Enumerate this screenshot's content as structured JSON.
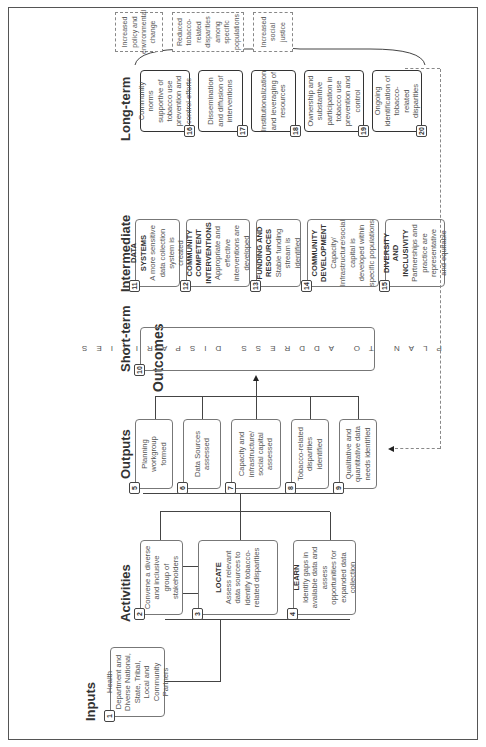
{
  "title": "Outcomes",
  "columns": {
    "inputs": "Inputs",
    "activities": "Activities",
    "outputs": "Outputs",
    "short_term": "Short-term",
    "intermediate": "Intermediate",
    "long_term": "Long-term"
  },
  "inputs": [
    {
      "num": "1",
      "text": "Health Department and Diverse National, State, Tribal, Local and Community Partners"
    }
  ],
  "activities": [
    {
      "num": "2",
      "title": "",
      "text": "Convene a diverse and inclusive group of stakeholders"
    },
    {
      "num": "3",
      "title": "LOCATE",
      "text": "Assess relevant data sources to identify tobacco-related disparities"
    },
    {
      "num": "4",
      "title": "LEARN",
      "text": "Identify gaps in available data and assess opportunities for expanded data collection"
    }
  ],
  "outputs": [
    {
      "num": "5",
      "text": "Planning workgroup formed"
    },
    {
      "num": "6",
      "text": "Data Sources assessed"
    },
    {
      "num": "7",
      "text": "Capacity and infrastructure/ social capital assessed"
    },
    {
      "num": "8",
      "text": "Tobacco-related disparities identified"
    },
    {
      "num": "9",
      "text": "Qualitative and quantitative data needs identified"
    }
  ],
  "short_term": {
    "num": "10",
    "text": "PLAN TO ADDRESS DISPARITIES"
  },
  "intermediate": [
    {
      "num": "11",
      "title": "DATA SYSTEMS",
      "text": "A more sensitive data collection system is created"
    },
    {
      "num": "12",
      "title": "COMMUNITY COMPETENT INTERVENTIONS",
      "text": "Appropriate and effective interventions are developed"
    },
    {
      "num": "13",
      "title": "FUNDING AND RESOURCES",
      "text": "Stable funding stream is identified"
    },
    {
      "num": "14",
      "title": "COMMUNITY DEVELOPMENT",
      "text": "Capacity/ Infrastructure/social capital is developed within specific populations"
    },
    {
      "num": "15",
      "title": "DIVERSITY AND INCLUSIVITY",
      "text": "Partnerships and practice are representative and equitable"
    }
  ],
  "long_term": [
    {
      "num": "16",
      "text": "Community norms supportive of tobacco use prevention and control efforts"
    },
    {
      "num": "17",
      "text": "Dissemination and diffusion of interventions"
    },
    {
      "num": "18",
      "text": "Institutionalization and leveraging of resources"
    },
    {
      "num": "19",
      "text": "Ownership and substantive participation in tobacco use prevention and control"
    },
    {
      "num": "20",
      "text": "Ongoing identification of tobacco-related disparities"
    }
  ],
  "impacts": [
    {
      "text": "Increased policy and environmental change"
    },
    {
      "text": "Reduced tobacco-related disparities among specific populations"
    },
    {
      "text": "Increased social justice"
    }
  ]
}
